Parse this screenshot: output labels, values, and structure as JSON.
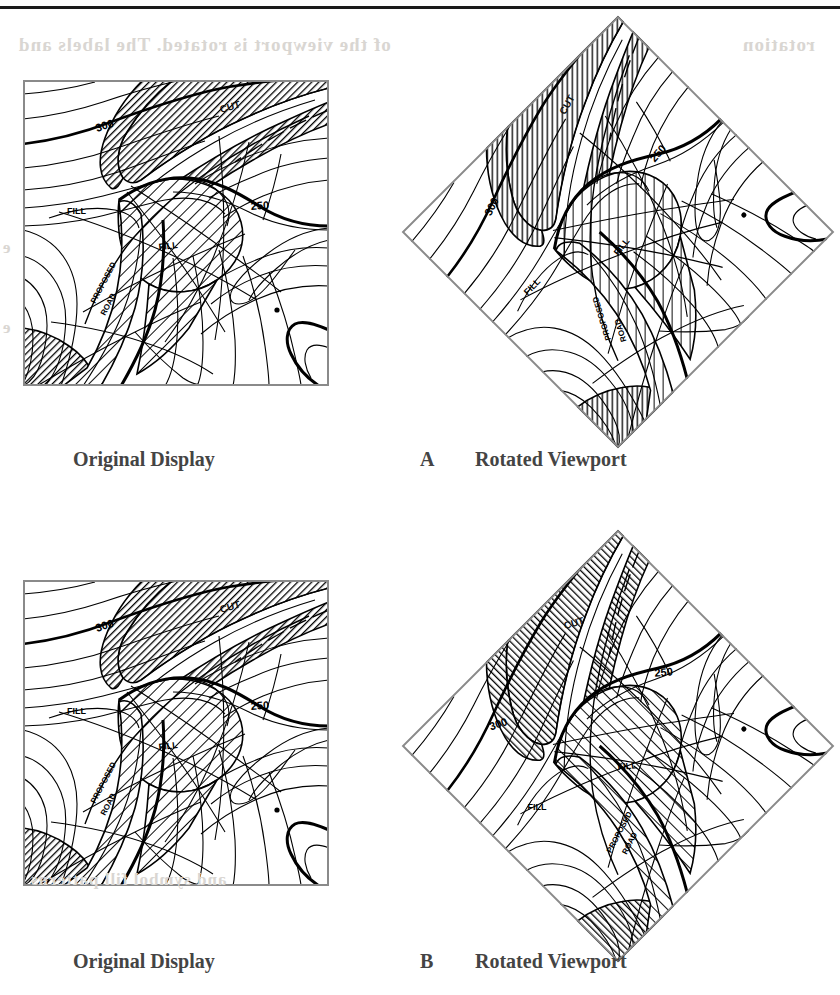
{
  "page": {
    "width": 840,
    "height": 995,
    "background": "#ffffff",
    "rule_color": "#1a1a1a",
    "bleed_through_color": "#d9d6d2",
    "bleed_through_text": [
      "of the viewport is rotated. The labels and",
      "e",
      "e",
      "rotation",
      "and symbol fill patterns"
    ]
  },
  "figure": {
    "type": "cartographic-rotation-comparison",
    "panels": [
      {
        "id": "A",
        "letter": "A",
        "left_caption": "Original Display",
        "right_caption": "Rotated Viewport",
        "rotation_degrees": 45,
        "rotate_labels_with_map": true,
        "rotate_fill_patterns_with_map": true,
        "description": "Naive rotation: text labels and area fill patterns rotate with the map"
      },
      {
        "id": "B",
        "letter": "B",
        "left_caption": "Original Display",
        "right_caption": "Rotated Viewport",
        "rotation_degrees": 45,
        "rotate_labels_with_map": false,
        "rotate_fill_patterns_with_map": false,
        "description": "Corrected rotation: text labels stay upright and fill patterns keep their original orientation"
      }
    ]
  },
  "map": {
    "frame_color": "#8a8a8a",
    "line_color": "#000000",
    "index_contour_color": "#000000",
    "viewport_size": 306,
    "contour_labels": [
      {
        "text": "300",
        "value": 300,
        "x": 74,
        "y": 52,
        "rotation": -18
      },
      {
        "text": "250",
        "value": 250,
        "x": 228,
        "y": 130,
        "rotation": -4
      }
    ],
    "area_labels": [
      {
        "text": "CUT",
        "x": 198,
        "y": 33,
        "rotation": -16,
        "fill": "hatch-dark"
      },
      {
        "text": "FILL",
        "x": 136,
        "y": 170,
        "rotation": -6,
        "fill": "hatch-light"
      },
      {
        "text": "FILL",
        "x": 52,
        "y": 131,
        "rotation": 0,
        "fill": "none"
      }
    ],
    "feature_labels": [
      {
        "text": "PROPOSED",
        "x": 76,
        "y": 222,
        "rotation": -62
      },
      {
        "text": "ROAD",
        "x": 84,
        "y": 232,
        "rotation": -62
      }
    ],
    "legend": {
      "cut_fill_pattern": "diagonal-hatch-dark",
      "fill_pattern": "diagonal-hatch-light",
      "contour_interval": 50,
      "contour_units": "feet"
    }
  }
}
